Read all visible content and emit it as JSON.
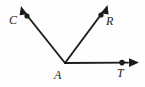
{
  "figure": {
    "type": "geometry-diagram",
    "background_color": "#fefefe",
    "stroke_color": "#1c1c1c",
    "label_color": "#1c1c1c",
    "vertex": {
      "name": "A",
      "x": 65,
      "y": 63
    },
    "labels": {
      "C": "C",
      "R": "R",
      "A": "A",
      "T": "T"
    },
    "rays": [
      {
        "name": "ray-AC",
        "from": "A",
        "to": "C",
        "start": {
          "x": 65,
          "y": 63
        },
        "dot": {
          "x": 27,
          "y": 16
        },
        "tip": {
          "x": 21,
          "y": 7
        },
        "has_arrowhead": true,
        "has_point_dot": true
      },
      {
        "name": "ray-AR",
        "from": "A",
        "to": "R",
        "start": {
          "x": 65,
          "y": 63
        },
        "dot": {
          "x": 101,
          "y": 15
        },
        "tip": {
          "x": 107,
          "y": 6
        },
        "has_arrowhead": true,
        "has_point_dot": true
      },
      {
        "name": "ray-AT",
        "from": "A",
        "to": "T",
        "start": {
          "x": 65,
          "y": 63
        },
        "dot": {
          "x": 122,
          "y": 63
        },
        "tip": {
          "x": 139,
          "y": 63
        },
        "has_arrowhead": true,
        "has_point_dot": true
      }
    ]
  }
}
